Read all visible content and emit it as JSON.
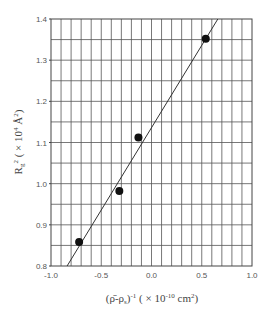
{
  "chart_data": {
    "type": "scatter",
    "title": "",
    "xlabel": "(ρ̄-ρs)-1 ( × 10-10 cm2)",
    "ylabel": "Rg2 ( × 104 Å2)",
    "xlim": [
      -1.0,
      1.0
    ],
    "ylim": [
      0.8,
      1.4
    ],
    "xticks": [
      "-1.0",
      "-0.5",
      "0.0",
      "0.5",
      "1.0"
    ],
    "yticks": [
      "0.8",
      "0.9",
      "1.0",
      "1.1",
      "1.2",
      "1.3",
      "1.4"
    ],
    "grid": true,
    "grid_x_step": 0.1,
    "grid_y_step": 0.05,
    "series": [
      {
        "name": "data",
        "marker": "filled-circle",
        "color": "#111111",
        "points": [
          {
            "x": -0.72,
            "y": 0.858
          },
          {
            "x": -0.32,
            "y": 0.982
          },
          {
            "x": -0.13,
            "y": 1.112
          },
          {
            "x": 0.54,
            "y": 1.352
          }
        ]
      }
    ],
    "fit_line": {
      "x1": -0.84,
      "y1": 0.8,
      "x2": 0.66,
      "y2": 1.4,
      "color": "#333333"
    }
  },
  "labels": {
    "x_axis": {
      "main": "(ρ̄-ρ",
      "sub": "s",
      "sup1": "-1",
      "rest": " ( × 10",
      "sup2": "-10",
      "unit": " cm",
      "sup3": "2",
      "end": ")"
    },
    "y_axis": {
      "main": "R",
      "sub": "g",
      "sup1": "2",
      "rest": " ( × 10",
      "sup2": "4",
      "unit": " Å",
      "sup3": "2",
      "end": ")"
    }
  }
}
